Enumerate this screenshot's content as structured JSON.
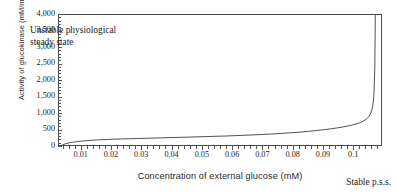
{
  "chart_data": {
    "type": "line",
    "title": "",
    "xlabel": "Concentration of external glucose (mM)",
    "ylabel": "Activity of glucokinase (mM/min)",
    "xlim": [
      0.0025,
      0.1095
    ],
    "ylim": [
      0,
      4000
    ],
    "grid": false,
    "legend": null,
    "x_ticks": [
      0.01,
      0.02,
      0.03,
      0.04,
      0.05,
      0.06,
      0.07,
      0.08,
      0.09,
      0.1
    ],
    "x_tick_labels": [
      "0.01",
      "0.02",
      "0.03",
      "0.04",
      "0.05",
      "0.06",
      "0.07",
      "0.08",
      "0.09",
      "0.1"
    ],
    "x_minor_step": 0.002,
    "y_ticks": [
      0,
      500,
      1000,
      1500,
      2000,
      2500,
      3000,
      3500,
      4000
    ],
    "y_tick_labels": [
      "0",
      "500",
      "1,000",
      "1,500",
      "2,000",
      "2,500",
      "3,000",
      "3,500",
      "4,000"
    ],
    "y_minor_step": 100,
    "series": [
      {
        "name": "glucokinase activity",
        "color": "#3d3d3d",
        "x": [
          0.0037,
          0.0042,
          0.0048,
          0.0055,
          0.0062,
          0.007,
          0.008,
          0.009,
          0.01,
          0.0115,
          0.013,
          0.015,
          0.017,
          0.019,
          0.021,
          0.0235,
          0.026,
          0.0285,
          0.031,
          0.034,
          0.037,
          0.04,
          0.043,
          0.046,
          0.049,
          0.052,
          0.055,
          0.058,
          0.061,
          0.064,
          0.067,
          0.07,
          0.073,
          0.076,
          0.079,
          0.082,
          0.085,
          0.088,
          0.0905,
          0.093,
          0.095,
          0.097,
          0.0985,
          0.1,
          0.1012,
          0.1024,
          0.1034,
          0.1042,
          0.1049,
          0.1055,
          0.106,
          0.1064,
          0.1067,
          0.1069,
          0.1071,
          0.1072,
          0.1073,
          0.1074,
          0.10745,
          0.1075,
          0.10755,
          0.1076
        ],
        "y": [
          8,
          22,
          40,
          58,
          72,
          85,
          98,
          110,
          120,
          133,
          143,
          155,
          164,
          172,
          179,
          187,
          194,
          200,
          206,
          214,
          221,
          229,
          236,
          244,
          252,
          260,
          269,
          278,
          288,
          299,
          311,
          324,
          338,
          354,
          372,
          392,
          416,
          444,
          470,
          500,
          527,
          558,
          584,
          616,
          646,
          684,
          724,
          766,
          818,
          880,
          960,
          1060,
          1180,
          1310,
          1490,
          1680,
          1930,
          2250,
          2520,
          2880,
          3380,
          4000
        ]
      }
    ],
    "annotations": [
      {
        "name": "unstable-branch-label",
        "text_line1": "Unstable physiological",
        "text_line2": "steady state"
      },
      {
        "name": "stable-branch-label",
        "text": "Stable p.s.s."
      }
    ]
  },
  "figure": {
    "background": "#ffffff",
    "frame_color": "#4a4a4a",
    "text_color": "#1c1c1c"
  }
}
